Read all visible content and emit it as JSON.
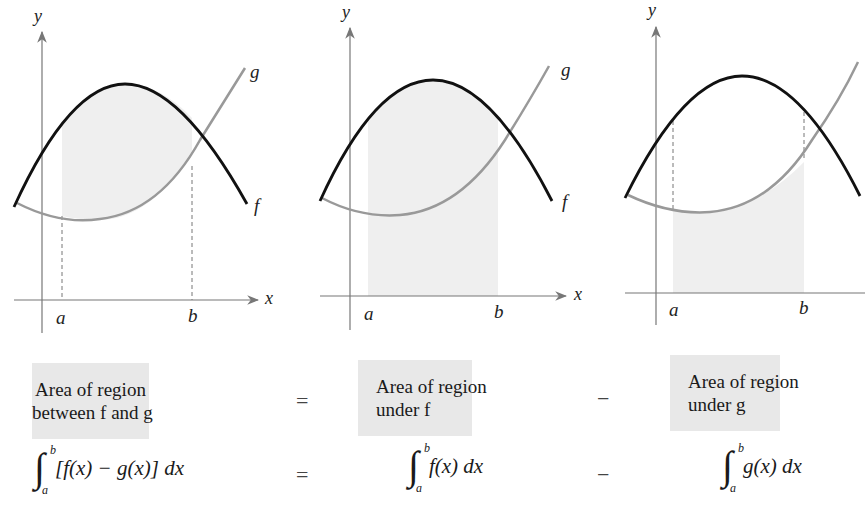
{
  "figure": {
    "panels": [
      {
        "id": "between",
        "axis_labels": {
          "x": "x",
          "y": "y"
        },
        "curve_labels": {
          "f": "f",
          "g": "g"
        },
        "limits": {
          "a": "a",
          "b": "b"
        },
        "shading": "between f and g"
      },
      {
        "id": "under_f",
        "axis_labels": {
          "x": "x",
          "y": "y"
        },
        "curve_labels": {
          "f": "f",
          "g": "g"
        },
        "limits": {
          "a": "a",
          "b": "b"
        },
        "shading": "under f"
      },
      {
        "id": "under_g",
        "axis_labels": {
          "y": "y"
        },
        "limits": {
          "a": "a",
          "b": "b"
        },
        "shading": "under g"
      }
    ],
    "colors": {
      "f_curve": "#111111",
      "g_curve": "#999999",
      "shade": "#efefef",
      "axis": "#777777",
      "label_box": "#e8e8e8"
    }
  },
  "equation": {
    "boxes": [
      {
        "line1": "Area of region",
        "line2": "between f and g"
      },
      {
        "line1": "Area of region",
        "line2": "under f"
      },
      {
        "line1": "Area of region",
        "line2": "under g"
      }
    ],
    "operators": [
      "=",
      "−"
    ],
    "formulas": [
      {
        "lower": "a",
        "upper": "b",
        "integrand": "[f(x) − g(x)] dx"
      },
      {
        "lower": "a",
        "upper": "b",
        "integrand": "f(x) dx"
      },
      {
        "lower": "a",
        "upper": "b",
        "integrand": "g(x) dx"
      }
    ]
  }
}
